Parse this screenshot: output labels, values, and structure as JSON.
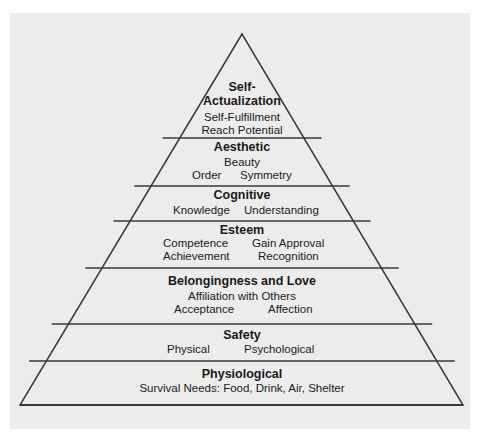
{
  "diagram": {
    "type": "pyramid",
    "levels": [
      {
        "title_line1": "Self-",
        "title_line2": "Actualization",
        "items": [
          "Self-Fulfillment",
          "Reach Potential"
        ]
      },
      {
        "title": "Aesthetic",
        "items": [
          "Beauty",
          "Order",
          "Symmetry"
        ]
      },
      {
        "title": "Cognitive",
        "items": [
          "Knowledge",
          "Understanding"
        ]
      },
      {
        "title": "Esteem",
        "items": [
          "Competence",
          "Gain Approval",
          "Achievement",
          "Recognition"
        ]
      },
      {
        "title": "Belongingness and Love",
        "items": [
          "Affiliation with Others",
          "Acceptance",
          "Affection"
        ]
      },
      {
        "title": "Safety",
        "items": [
          "Physical",
          "Psychological"
        ]
      },
      {
        "title": "Physiological",
        "items": [
          "Survival Needs: Food, Drink, Air, Shelter"
        ]
      }
    ],
    "colors": {
      "background": "#ececec",
      "line": "#3a3a3a",
      "text": "#1a1a1a"
    }
  }
}
